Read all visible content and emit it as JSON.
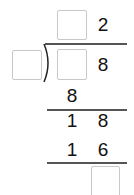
{
  "problem": {
    "type": "long-division",
    "quotient": {
      "tens": "",
      "ones": "2"
    },
    "divisor": "",
    "dividend": {
      "tens": "",
      "ones": "8"
    },
    "steps": [
      {
        "row": "first-product",
        "digits": [
          "8"
        ]
      },
      {
        "row": "first-remainder",
        "digits": [
          "1",
          "8"
        ]
      },
      {
        "row": "second-product",
        "digits": [
          "1",
          "6"
        ]
      },
      {
        "row": "final-remainder",
        "digits": [
          ""
        ]
      }
    ]
  },
  "colors": {
    "box_border": "#c8c8c8",
    "line": "#555555",
    "text": "#111111"
  }
}
